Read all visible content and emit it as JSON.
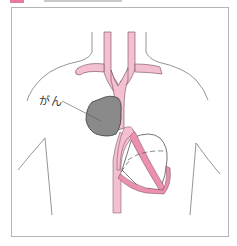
{
  "figure": {
    "label_color": "#e8799f",
    "frame_color": "#b5b5b5"
  },
  "diagram": {
    "labels": {
      "tumor": "がん"
    },
    "colors": {
      "vessel_fill": "#f5bfd2",
      "vessel_dark": "#ec8fb0",
      "vessel_outline": "#6b4a55",
      "tumor_fill": "#8a8a8a",
      "tumor_outline": "#3a3a3a",
      "body_outline": "#7a7a7a"
    },
    "parts": [
      "body-outline",
      "neck",
      "shoulders",
      "arteries",
      "aorta",
      "heart",
      "tumor"
    ]
  }
}
